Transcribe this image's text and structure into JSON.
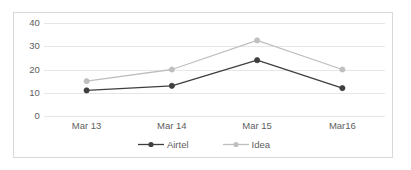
{
  "chart_data": {
    "type": "line",
    "title": "",
    "subtitle": "",
    "xlabel": "",
    "ylabel": "",
    "categories": [
      "Mar 13",
      "Mar 14",
      "Mar 15",
      "Mar16"
    ],
    "series": [
      {
        "name": "Airtel",
        "color": "#3f3f3f",
        "marker": "circle",
        "values": [
          11,
          13,
          24,
          12
        ]
      },
      {
        "name": "Idea",
        "color": "#bfbfbf",
        "marker": "circle",
        "values": [
          15,
          20,
          32.5,
          20
        ]
      }
    ],
    "ylim": [
      0,
      40
    ],
    "ytick_labels": [
      "0",
      "10",
      "20",
      "30",
      "40"
    ],
    "ytick_values": [
      0,
      10,
      20,
      30,
      40
    ],
    "grid": true,
    "grid_color": "#e6e6e6",
    "legend_position": "bottom",
    "border_color": "#d9d9d9",
    "background_color": "#ffffff",
    "axis_text_color": "#5e5e5e"
  }
}
